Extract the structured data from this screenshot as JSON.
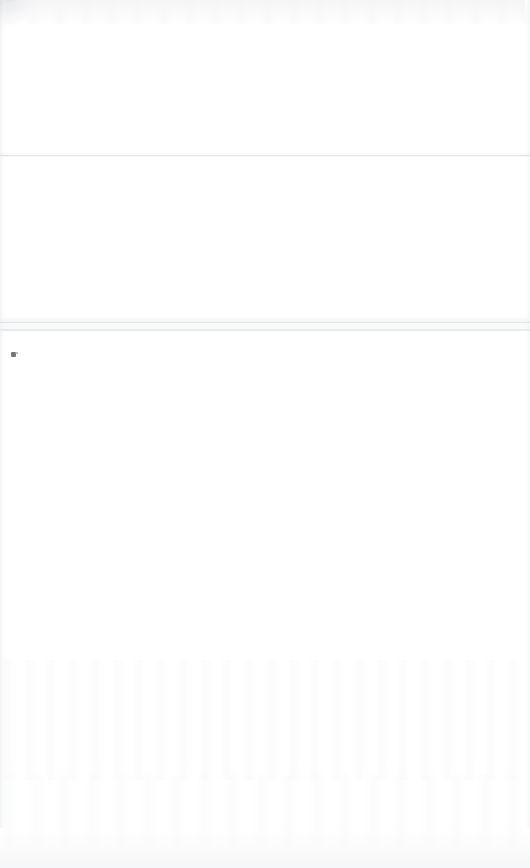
{
  "page": {
    "background_color": "#ffffff",
    "width": 530,
    "height": 868,
    "state_label": "",
    "description_label": ""
  },
  "regions": {
    "header": {
      "name_label": "",
      "content": ""
    },
    "middle": {
      "name_label": "",
      "content": ""
    },
    "body": {
      "name_label": "",
      "content": ""
    }
  },
  "rules": {
    "primary": {
      "label": "",
      "color": "#e2e4e6",
      "y": 155
    },
    "pair_upper": {
      "label": "",
      "color": "#e0e2e5",
      "y": 322
    },
    "pair_lower": {
      "label": "",
      "color": "#e4e6e9",
      "y": 329
    }
  },
  "marks": {
    "speck": {
      "label": "",
      "color": "#55585c",
      "x": 11,
      "y": 352
    }
  }
}
